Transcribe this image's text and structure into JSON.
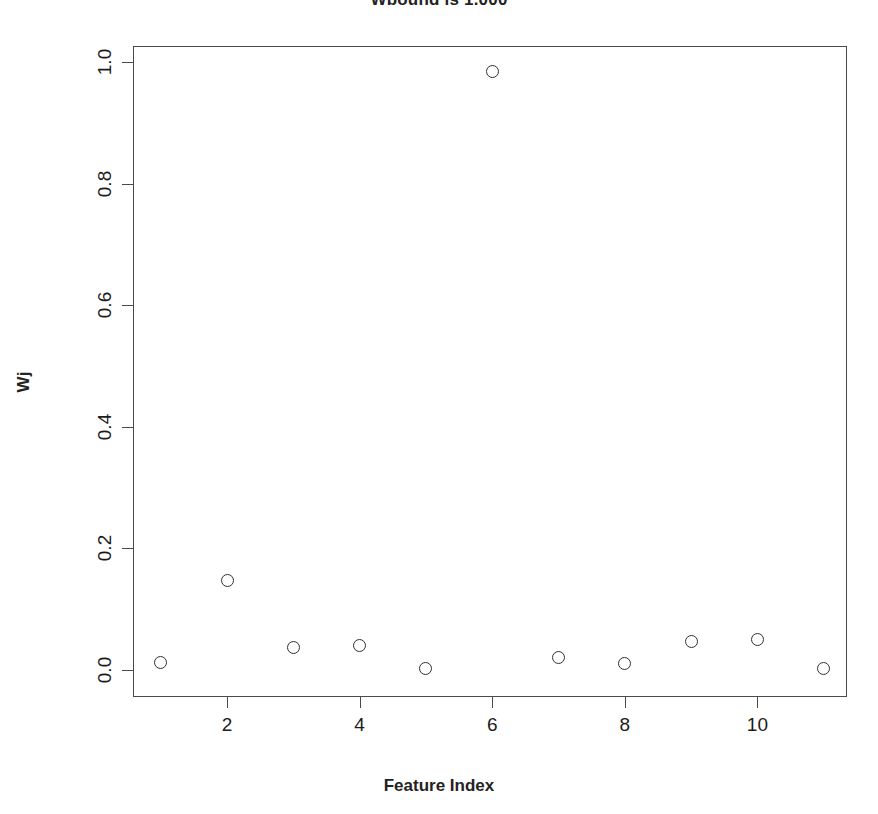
{
  "chart_data": {
    "type": "scatter",
    "title": "Wbound is 1.000",
    "xlabel": "Feature Index",
    "ylabel": "Wj",
    "x": [
      1,
      2,
      3,
      4,
      5,
      6,
      7,
      8,
      9,
      10,
      11
    ],
    "values": [
      0.013,
      0.148,
      0.037,
      0.04,
      0.002,
      0.984,
      0.021,
      0.011,
      0.047,
      0.05,
      0.002
    ],
    "xlim": [
      0.55,
      11.45
    ],
    "ylim": [
      -0.015,
      1.015
    ],
    "xticks": [
      2,
      4,
      6,
      8,
      10
    ],
    "xtick_labels": [
      "2",
      "4",
      "6",
      "8",
      "10"
    ],
    "yticks": [
      0.0,
      0.2,
      0.4,
      0.6,
      0.8,
      1.0
    ],
    "ytick_labels": [
      "0.0",
      "0.2",
      "0.4",
      "0.6",
      "0.8",
      "1.0"
    ],
    "grid": false,
    "legend": null,
    "marker": "open-circle",
    "marker_color": "#303030",
    "background": "#ffffff",
    "axis_color": "#4a4a4a"
  },
  "figure": {
    "plot_box": {
      "left": 133,
      "top": 46,
      "width": 714,
      "height": 651
    },
    "y_pixel_zero": 670,
    "y_pixel_one": 62,
    "x_pixel_two": 227,
    "x_pixel_step": 66.3
  }
}
